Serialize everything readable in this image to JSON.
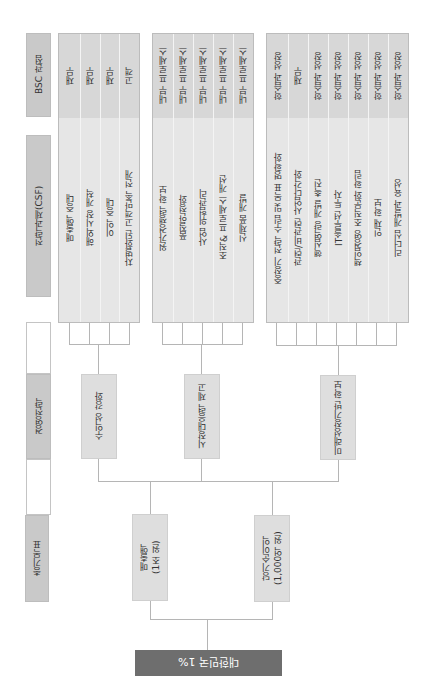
{
  "headers": {
    "bsc": "BSC 관점",
    "csf": "전략과제(CSF)",
    "strategy": "경영전략",
    "goal": "총기목표"
  },
  "root": {
    "label": "대한민국 1%"
  },
  "goals": [
    {
      "label": "매출액\n(1조 원)"
    },
    {
      "label": "당기순이익\n(1,000억 원)"
    }
  ],
  "strategies": [
    {
      "label": "수익성 강화"
    },
    {
      "label": "시장대응력 제고"
    },
    {
      "label": "미래성장기반 확보"
    }
  ],
  "groups": [
    {
      "csf": [
        "매출액 증대",
        "해외시장 개척",
        "이익 증대",
        "차별화된 고객만족 전개"
      ],
      "bsc": [
        "재무",
        "재무",
        "재무",
        "고객"
      ]
    },
    {
      "csf": [
        "원가경쟁력 확보",
        "품질안정화",
        "사업 위험관리",
        "조직& 프로세스 개선",
        "신제품 개발"
      ],
      "bsc": [
        "내부 프로세스",
        "내부 프로세스",
        "내부 프로세스",
        "내부 프로세스",
        "내부 프로세스"
      ]
    },
    {
      "csf": [
        "중장기 전략 수립 및 목표 명확화",
        "관련/비관련 사업다각화",
        "핵심역량 개발 촉진",
        "IT솔루션 투자",
        "책임경영 조직문화 확립",
        "인재 확보",
        "리더십 개발과 육성"
      ],
      "bsc": [
        "학습과 성장",
        "재무",
        "학습과 성장",
        "학습과 성장",
        "학습과 성장",
        "학습과 성장",
        "학습과 성장"
      ]
    }
  ],
  "colors": {
    "root": "#6e6e6e",
    "header": "#c9c9c9",
    "panel": "#e6e6e6",
    "node": "#dedede",
    "line": "#b5b5b5"
  }
}
